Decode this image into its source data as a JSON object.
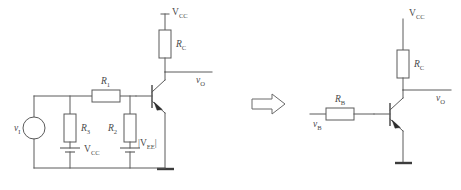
{
  "figure": {
    "line_color": "#5a5a5a",
    "text_color": "#4a4a4a",
    "background": "#ffffff"
  },
  "left_circuit": {
    "name": "original-bias-circuit",
    "source": {
      "symbol": "circle-voltage-source",
      "label_v": "v",
      "label_sub": "I"
    },
    "supply_top": {
      "label_v": "V",
      "label_sub": "CC"
    },
    "collector_resistor": {
      "label_v": "R",
      "label_sub": "C"
    },
    "output": {
      "label_v": "v",
      "label_sub": "O"
    },
    "resistor_r1": {
      "label_v": "R",
      "label_sub": "1"
    },
    "resistor_r2": {
      "label_v": "R",
      "label_sub": "2"
    },
    "resistor_r3": {
      "label_v": "R",
      "label_sub": "3"
    },
    "battery_vcc": {
      "symbol": "battery",
      "label_v": "V",
      "label_sub": "CC"
    },
    "battery_vee": {
      "symbol": "battery",
      "label_open": "|",
      "label_v": "V",
      "label_sub": "EE",
      "label_close": "|"
    },
    "transistor": {
      "type": "npn",
      "name": "npn-transistor"
    },
    "ground": {
      "symbol": "ground-bar"
    }
  },
  "transform_arrow": {
    "name": "implies-block-arrow",
    "direction": "right"
  },
  "right_circuit": {
    "name": "equivalent-bias-circuit",
    "supply_top": {
      "label_v": "V",
      "label_sub": "CC"
    },
    "collector_resistor": {
      "label_v": "R",
      "label_sub": "C"
    },
    "output": {
      "label_v": "v",
      "label_sub": "O"
    },
    "base_resistor": {
      "label_v": "R",
      "label_sub": "B"
    },
    "base_source": {
      "label_v": "v",
      "label_sub": "B"
    },
    "transistor": {
      "type": "npn",
      "name": "npn-transistor"
    },
    "ground": {
      "symbol": "ground-bar"
    }
  }
}
